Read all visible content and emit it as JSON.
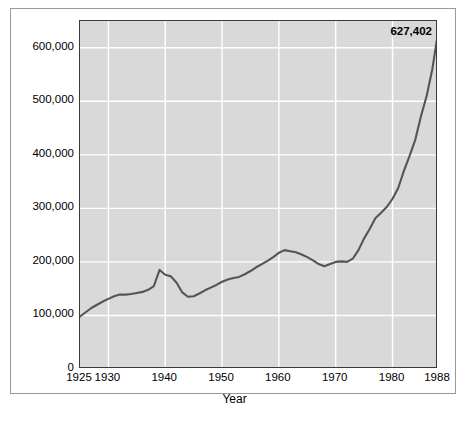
{
  "chart_data": {
    "type": "line",
    "title": "",
    "xlabel": "Year",
    "ylabel": "Number",
    "xlim": [
      1925,
      1988
    ],
    "ylim": [
      0,
      650000
    ],
    "grid": true,
    "legend": false,
    "annotations": [
      {
        "text": "627,402",
        "x": 1988,
        "y": 627402,
        "position": "top-right"
      }
    ],
    "xticks": [
      1925,
      1930,
      1940,
      1950,
      1960,
      1970,
      1980,
      1988
    ],
    "xticklabels": [
      "1925",
      "1930",
      "1940",
      "1950",
      "1960",
      "1970",
      "1980",
      "1988"
    ],
    "yticks": [
      0,
      100000,
      200000,
      300000,
      400000,
      500000,
      600000
    ],
    "yticklabels": [
      "0",
      "100,000",
      "200,000",
      "300,000",
      "400,000",
      "500,000",
      "600,000"
    ],
    "x": [
      1925,
      1926,
      1927,
      1928,
      1929,
      1930,
      1931,
      1932,
      1933,
      1934,
      1935,
      1936,
      1937,
      1938,
      1939,
      1940,
      1941,
      1942,
      1943,
      1944,
      1945,
      1946,
      1947,
      1948,
      1949,
      1950,
      1951,
      1952,
      1953,
      1954,
      1955,
      1956,
      1957,
      1958,
      1959,
      1960,
      1961,
      1962,
      1963,
      1964,
      1965,
      1966,
      1967,
      1968,
      1969,
      1970,
      1971,
      1972,
      1973,
      1974,
      1975,
      1976,
      1977,
      1978,
      1979,
      1980,
      1981,
      1982,
      1983,
      1984,
      1985,
      1986,
      1987,
      1988
    ],
    "values": [
      98000,
      106000,
      114000,
      120000,
      126000,
      131000,
      136000,
      139000,
      139000,
      140000,
      142000,
      144000,
      148000,
      155000,
      185000,
      176000,
      173000,
      161000,
      143000,
      135000,
      136000,
      141000,
      147000,
      152000,
      157000,
      163000,
      167000,
      170000,
      172000,
      177000,
      183000,
      190000,
      196000,
      202000,
      209000,
      217000,
      222000,
      220000,
      218000,
      214000,
      209000,
      203000,
      196000,
      192000,
      196000,
      200000,
      201000,
      200000,
      206000,
      222000,
      244000,
      262000,
      282000,
      292000,
      303000,
      318000,
      338000,
      370000,
      398000,
      428000,
      472000,
      510000,
      560000,
      627402
    ],
    "series_color": "#555555",
    "plot_background": "#d9d9d9",
    "gridline_color": "#ffffff",
    "axis_border_color": "#3a3a3a"
  }
}
